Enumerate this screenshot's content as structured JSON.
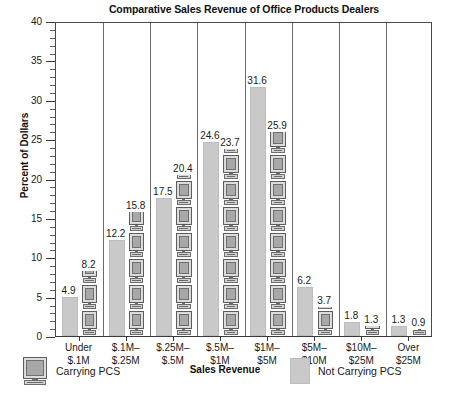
{
  "chart_data": {
    "type": "bar",
    "title": "Comparative Sales Revenue of Office Products Dealers",
    "xlabel": "Sales Revenue",
    "ylabel": "Percent of Dollars",
    "ylim": [
      0,
      40
    ],
    "yticks": [
      0,
      5,
      10,
      15,
      20,
      25,
      30,
      35,
      40
    ],
    "ytick_minor_step": 1,
    "grid": false,
    "legend_position": "bottom",
    "categories": [
      "Under $.1M",
      "$.1M–$.25M",
      "$.25M–$.5M",
      "$.5M–$1M",
      "$1M–$5M",
      "$5M–$10M",
      "$10M–$25M",
      "Over $25M"
    ],
    "category_lines": [
      [
        "Under",
        "$.1M"
      ],
      [
        "$.1M–",
        "$.25M"
      ],
      [
        "$.25M–",
        "$.5M"
      ],
      [
        "$.5M–",
        "$1M"
      ],
      [
        "$1M–",
        "$5M"
      ],
      [
        "$5M–",
        "$10M"
      ],
      [
        "$10M–",
        "$25M"
      ],
      [
        "Over",
        "$25M"
      ]
    ],
    "series": [
      {
        "name": "Not Carrying PCS",
        "style": "plain-gray-bar",
        "color": "#c9c9c9",
        "values": [
          4.9,
          12.2,
          17.5,
          24.6,
          31.6,
          6.2,
          1.8,
          1.3
        ]
      },
      {
        "name": "Carrying PCS",
        "style": "stacked-computer-icons",
        "color": "#a8a8a8",
        "values": [
          8.2,
          15.8,
          20.4,
          23.7,
          25.9,
          3.7,
          1.3,
          0.9
        ]
      }
    ]
  },
  "legend": {
    "carrying_label": "Carrying PCS",
    "not_carrying_label": "Not Carrying PCS",
    "carrying_icon": "computer-monitor-icon",
    "not_carrying_icon": "gray-square-swatch"
  }
}
